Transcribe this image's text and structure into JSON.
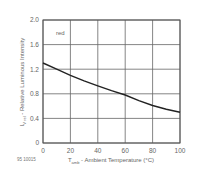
{
  "chart_data": {
    "type": "line",
    "title": "",
    "xlabel": "T_amb - Ambient Temperature (°C)",
    "ylabel": "I_V rel - Relative Luminous Intensity",
    "xlim": [
      0,
      100
    ],
    "ylim": [
      0,
      2.0
    ],
    "x_ticks": [
      "0",
      "20",
      "40",
      "60",
      "80",
      "100"
    ],
    "y_ticks": [
      "0",
      "0.4",
      "0.8",
      "1.2",
      "1.6",
      "2.0"
    ],
    "grid": true,
    "annotations": [
      "red"
    ],
    "figure_id": "95 10015",
    "series": [
      {
        "name": "red",
        "x": [
          0,
          10,
          20,
          30,
          40,
          50,
          60,
          70,
          80,
          90,
          100
        ],
        "values": [
          1.3,
          1.2,
          1.1,
          1.01,
          0.93,
          0.85,
          0.78,
          0.69,
          0.61,
          0.55,
          0.5
        ]
      }
    ]
  },
  "labels": {
    "ylabel_main": "I",
    "ylabel_sub": "V rel",
    "ylabel_rest": " - Relative Luminous Intensity",
    "xlabel_main": "T",
    "xlabel_sub": "amb",
    "xlabel_rest": " - Ambient Temperature (°C)",
    "series_label": "red",
    "figure_id": "95 10015"
  }
}
